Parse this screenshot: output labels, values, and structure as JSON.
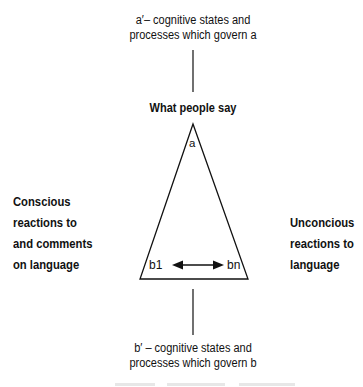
{
  "diagram": {
    "top_label": {
      "line1": "a′– cognitive states and",
      "line2": "processes which govern a"
    },
    "apex_title": "What people say",
    "apex_node": "a",
    "left_label": {
      "line1": "Conscious",
      "line2": "reactions to",
      "line3": "and comments",
      "line4": "on language"
    },
    "right_label": {
      "line1": "Unconcious",
      "line2": "reactions to",
      "line3": "language"
    },
    "base_left_node": "b1",
    "base_right_node": "bn",
    "bottom_label": {
      "line1": "b′ – cognitive states and",
      "line2": "processes which govern b"
    },
    "edges": [
      {
        "from": "a′",
        "to": "a",
        "type": "line"
      },
      {
        "from": "a",
        "to": "b1",
        "type": "line"
      },
      {
        "from": "a",
        "to": "bn",
        "type": "line"
      },
      {
        "from": "b1",
        "to": "bn",
        "type": "double-arrow"
      },
      {
        "from": "b",
        "to": "b′",
        "type": "line"
      }
    ],
    "colors": {
      "stroke": "#111111",
      "background": "#ffffff"
    }
  }
}
